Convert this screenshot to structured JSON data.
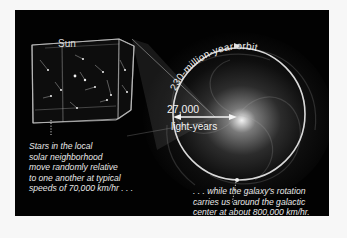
{
  "figure": {
    "cube_label": "Sun",
    "orbit_label": "230-million-year orbit",
    "distance": {
      "value": "27,000",
      "unit": "light-years"
    },
    "captions": {
      "local_motion": [
        "Stars in the local",
        "solar neighborhood",
        "move randomly relative",
        "to one another at typical",
        "speeds of 70,000 km/hr . . ."
      ],
      "galactic_motion": [
        ". . . while the galaxy's rotation",
        "carries us around the galactic",
        "center at about 800,000 km/hr."
      ]
    },
    "colors": {
      "background": "#020202",
      "page": "#f7f7f7",
      "orbit": "#d9d9d9",
      "text": "#e8e8e8"
    }
  }
}
